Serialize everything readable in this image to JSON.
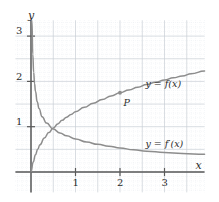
{
  "figure": {
    "axis_labels": {
      "x": "x",
      "y": "y"
    },
    "x_ticks": [
      "1",
      "2",
      "3"
    ],
    "y_ticks": [
      "1",
      "2",
      "3"
    ],
    "curve_label_f": "y = f(x)",
    "curve_label_fprime": "y = f′(x)",
    "point_label": "P",
    "colors": {
      "curve": "#8d8d8d",
      "axis": "#5a5a5a",
      "grid_major": "#c9cfd6",
      "grid_minor": "#dfe4ea",
      "text": "#2b2b2b"
    }
  },
  "chart_data": {
    "type": "line",
    "title": "",
    "xlabel": "x",
    "ylabel": "y",
    "xlim": [
      -0.35,
      3.9
    ],
    "ylim": [
      -0.45,
      3.35
    ],
    "grid": true,
    "grid_step": 0.5,
    "legend": "inline-labels",
    "xticks": [
      1,
      2,
      3
    ],
    "yticks": [
      1,
      2,
      3
    ],
    "series": [
      {
        "name": "y = f(x)",
        "label_at": [
          2.55,
          1.95
        ],
        "points": [
          [
            0.0,
            0.0
          ],
          [
            0.05,
            0.22
          ],
          [
            0.1,
            0.38
          ],
          [
            0.15,
            0.5
          ],
          [
            0.2,
            0.6
          ],
          [
            0.3,
            0.75
          ],
          [
            0.4,
            0.87
          ],
          [
            0.5,
            0.97
          ],
          [
            0.6,
            1.06
          ],
          [
            0.7,
            1.14
          ],
          [
            0.8,
            1.21
          ],
          [
            0.9,
            1.27
          ],
          [
            1.0,
            1.33
          ],
          [
            1.2,
            1.43
          ],
          [
            1.4,
            1.52
          ],
          [
            1.6,
            1.6
          ],
          [
            1.8,
            1.68
          ],
          [
            2.0,
            1.75
          ],
          [
            2.2,
            1.81
          ],
          [
            2.4,
            1.87
          ],
          [
            2.6,
            1.93
          ],
          [
            2.8,
            1.98
          ],
          [
            3.0,
            2.03
          ],
          [
            3.2,
            2.08
          ],
          [
            3.4,
            2.12
          ],
          [
            3.6,
            2.17
          ],
          [
            3.9,
            2.23
          ]
        ]
      },
      {
        "name": "y = f′(x)",
        "label_at": [
          2.55,
          0.62
        ],
        "points": [
          [
            0.02,
            3.35
          ],
          [
            0.04,
            2.6
          ],
          [
            0.06,
            2.2
          ],
          [
            0.08,
            1.95
          ],
          [
            0.1,
            1.78
          ],
          [
            0.14,
            1.55
          ],
          [
            0.18,
            1.4
          ],
          [
            0.25,
            1.22
          ],
          [
            0.35,
            1.08
          ],
          [
            0.5,
            0.95
          ],
          [
            0.65,
            0.86
          ],
          [
            0.8,
            0.8
          ],
          [
            1.0,
            0.73
          ],
          [
            1.25,
            0.66
          ],
          [
            1.5,
            0.61
          ],
          [
            1.75,
            0.57
          ],
          [
            2.0,
            0.53
          ],
          [
            2.3,
            0.49
          ],
          [
            2.6,
            0.46
          ],
          [
            3.0,
            0.43
          ],
          [
            3.4,
            0.41
          ],
          [
            3.9,
            0.39
          ]
        ]
      }
    ],
    "annotations": [
      {
        "label": "P",
        "x": 2.0,
        "y": 1.75,
        "marker": true,
        "label_offset": [
          0.08,
          -0.22
        ]
      }
    ]
  }
}
